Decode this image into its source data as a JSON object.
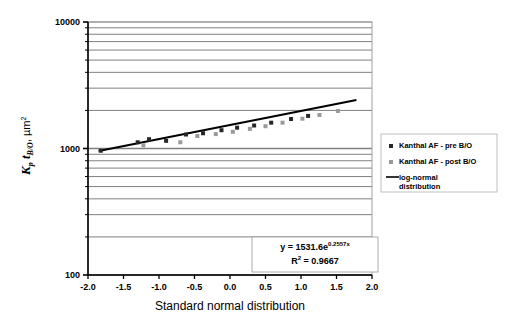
{
  "chart_data": {
    "type": "scatter",
    "title": "",
    "xlabel": "Standard normal distribution",
    "ylabel": "Kp tB/O , µm2",
    "ylabel_parts": {
      "k": "K",
      "k_sub": "p",
      "t": "t",
      "t_sub": "B/O",
      "comma": ",",
      "unit": "µm",
      "unit_sup": "2"
    },
    "xlim": [
      -2.0,
      2.0
    ],
    "ylim": [
      100,
      10000
    ],
    "yscale": "log",
    "xticks": [
      "-2.0",
      "-1.5",
      "-1.0",
      "-0.5",
      "0.0",
      "0.5",
      "1.0",
      "1.5",
      "2.0"
    ],
    "xtick_values": [
      -2.0,
      -1.5,
      -1.0,
      -0.5,
      0.0,
      0.5,
      1.0,
      1.5,
      2.0
    ],
    "yticks": [
      "10000",
      "1000",
      "100"
    ],
    "ytick_values": [
      10000,
      1000,
      100
    ],
    "grid": "horizontal-minor-log",
    "legend_position": "right-middle",
    "series": [
      {
        "name": "Kanthal AF - pre B/O",
        "marker": "square",
        "color": "#262626",
        "points": [
          {
            "x": -1.82,
            "y": 960
          },
          {
            "x": -1.3,
            "y": 1120
          },
          {
            "x": -1.14,
            "y": 1185
          },
          {
            "x": -0.9,
            "y": 1150
          },
          {
            "x": -0.62,
            "y": 1290
          },
          {
            "x": -0.38,
            "y": 1320
          },
          {
            "x": -0.12,
            "y": 1395
          },
          {
            "x": 0.1,
            "y": 1460
          },
          {
            "x": 0.34,
            "y": 1520
          },
          {
            "x": 0.58,
            "y": 1600
          },
          {
            "x": 0.86,
            "y": 1710
          },
          {
            "x": 1.1,
            "y": 1810
          }
        ]
      },
      {
        "name": "Kanthal AF - post B/O",
        "marker": "square",
        "color": "#9a9a9a",
        "points": [
          {
            "x": -1.22,
            "y": 1060
          },
          {
            "x": -0.7,
            "y": 1120
          },
          {
            "x": -0.46,
            "y": 1255
          },
          {
            "x": -0.2,
            "y": 1300
          },
          {
            "x": 0.04,
            "y": 1355
          },
          {
            "x": 0.28,
            "y": 1430
          },
          {
            "x": 0.5,
            "y": 1500
          },
          {
            "x": 0.74,
            "y": 1600
          },
          {
            "x": 1.02,
            "y": 1720
          },
          {
            "x": 1.26,
            "y": 1840
          },
          {
            "x": 1.52,
            "y": 1980
          }
        ]
      }
    ],
    "trendline": {
      "name": "log-normal distribution",
      "color": "#000000",
      "equation": "y = 1531.6e",
      "equation_exponent": "0.2557x",
      "r2_label": "R",
      "r2_sup": "2",
      "r2_value": " = 0.9667",
      "coefficient": 1531.6,
      "rate": 0.2557,
      "r_squared": 0.9667,
      "x_start": -1.85,
      "x_end": 1.78
    }
  },
  "legend": {
    "items": [
      {
        "label": "Kanthal AF - pre B/O",
        "type": "marker",
        "color": "#262626"
      },
      {
        "label": "Kanthal AF - post B/O",
        "type": "marker",
        "color": "#9a9a9a"
      },
      {
        "label": "log-normal",
        "label2": "distribution",
        "type": "line",
        "color": "#000000"
      }
    ]
  },
  "colors": {
    "axis": "#000000",
    "gridline": "#808080",
    "plot_border": "#a0a0a0",
    "series_pre": "#262626",
    "series_post": "#9a9a9a",
    "trendline": "#000000"
  }
}
